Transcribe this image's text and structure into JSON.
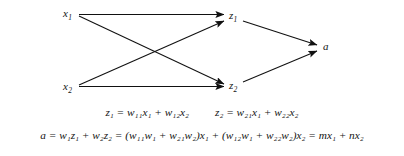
{
  "figure": {
    "type": "neural-network-diagram",
    "background_color": "#ffffff",
    "line_color": "#111111",
    "nodes": [
      {
        "id": "x1",
        "label": "x",
        "sub": "1",
        "x": 63,
        "y": 14,
        "layer": "input"
      },
      {
        "id": "x2",
        "label": "x",
        "sub": "2",
        "x": 63,
        "y": 88,
        "layer": "input"
      },
      {
        "id": "z1",
        "label": "z",
        "sub": "1",
        "x": 229,
        "y": 17,
        "layer": "hidden"
      },
      {
        "id": "z2",
        "label": "z",
        "sub": "2",
        "x": 229,
        "y": 87,
        "layer": "hidden"
      },
      {
        "id": "a",
        "label": "a",
        "sub": "",
        "x": 323,
        "y": 48,
        "layer": "output"
      }
    ],
    "edges": [
      {
        "from": "x1",
        "to": "z1"
      },
      {
        "from": "x1",
        "to": "z2"
      },
      {
        "from": "x2",
        "to": "z1"
      },
      {
        "from": "x2",
        "to": "z2"
      },
      {
        "from": "z1",
        "to": "a"
      },
      {
        "from": "z2",
        "to": "a"
      }
    ]
  },
  "equations": {
    "line1": {
      "left": "z₁ = w₁₁x₁ + w₁₂x₂",
      "right": "z₂ = w₂₁x₁ + w₂₂x₂"
    },
    "line2": "a = w₁z₁ + w₂z₂ = (w₁₁w₁ + w₂₁w₂)x₁ + (w₁₂w₁ + w₂₂w₂)x₂ = mx₁ + nx₂"
  }
}
